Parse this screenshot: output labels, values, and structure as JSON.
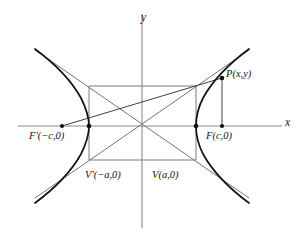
{
  "figure": {
    "kind": "hyperbola-diagram",
    "title_visible": false,
    "background_color": "#ffffff",
    "width": 308,
    "height": 238
  },
  "axes": {
    "x_label": "x",
    "y_label": "y",
    "origin_px": [
      142,
      126
    ],
    "x_axis_px": {
      "x1": 18,
      "y1": 126,
      "x2": 282,
      "y2": 126
    },
    "y_axis_px": {
      "x1": 142,
      "y1": 14,
      "x2": 142,
      "y2": 228
    },
    "axis_color": "#8a8a8a"
  },
  "labels": {
    "focus_left": "F'(−c,0)",
    "focus_right": "F(c,0)",
    "vertex_left": "V'(−a,0)",
    "vertex_right": "V(a,0)",
    "point_p": "P(x,y)",
    "x_axis": "x",
    "y_axis": "y"
  },
  "points": {
    "focus_left_px": [
      62,
      126
    ],
    "focus_right_px": [
      222,
      126
    ],
    "vertex_left_px": [
      89,
      126
    ],
    "vertex_right_px": [
      196,
      126
    ],
    "point_p_px": [
      222,
      78
    ],
    "marker_color": "#111111"
  },
  "central_box": {
    "left_px": 89,
    "right_px": 196,
    "top_px": 86,
    "bottom_px": 160,
    "stroke_color": "#7a7a7a"
  },
  "curve": {
    "stroke_color": "#141414",
    "stroke_width": 1.7,
    "branches": 2,
    "description": "right and left branches of a horizontal hyperbola"
  },
  "asymptotes": {
    "stroke_color": "#5a5a5a",
    "count": 2,
    "description": "diagonals of the central box extended to the corners"
  },
  "focal_rays": {
    "stroke_color": "#2a2a2a",
    "description": "segments from P to each focus"
  }
}
